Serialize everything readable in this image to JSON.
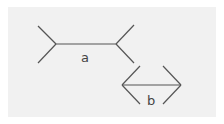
{
  "diagram": {
    "background": "#f1f1f1",
    "stroke_color": "#555555",
    "figures": [
      {
        "label": "a",
        "type": "fins-outward",
        "shaft": {
          "x1": 56,
          "y1": 44,
          "x2": 116,
          "y2": 44
        },
        "fins": [
          [
            56,
            44,
            38,
            26
          ],
          [
            56,
            44,
            38,
            63
          ],
          [
            116,
            44,
            134,
            25
          ],
          [
            116,
            44,
            134,
            63
          ]
        ],
        "label_pos": {
          "x": 81,
          "y": 62
        }
      },
      {
        "label": "b",
        "type": "fins-inward",
        "shaft": {
          "x1": 122,
          "y1": 85,
          "x2": 181,
          "y2": 85
        },
        "fins": [
          [
            122,
            85,
            140,
            66
          ],
          [
            122,
            85,
            140,
            104
          ],
          [
            181,
            85,
            163,
            66
          ],
          [
            181,
            85,
            163,
            104
          ]
        ],
        "label_pos": {
          "x": 147,
          "y": 105
        }
      }
    ]
  }
}
